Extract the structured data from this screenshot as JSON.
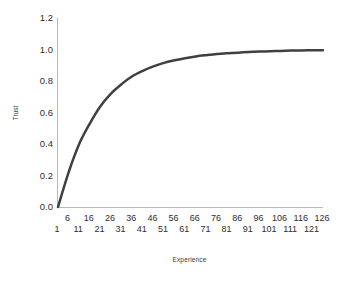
{
  "chart_data": {
    "type": "line",
    "title": "",
    "xlabel": "Experience",
    "ylabel": "Trust",
    "xlim": [
      1,
      126
    ],
    "ylim": [
      0.0,
      1.2
    ],
    "grid": false,
    "legend": null,
    "line_color": "#404040",
    "line_width": 2.5,
    "axis_color": "#b9b9b9",
    "background": "#ffffff",
    "ytick_labels": [
      "1.2",
      "1.0",
      "0.8",
      "0.6",
      "0.4",
      "0.2",
      "0.0"
    ],
    "ytick_values": [
      1.2,
      1.0,
      0.8,
      0.6,
      0.4,
      0.2,
      0.0
    ],
    "xtick_labels_top": [
      "6",
      "16",
      "26",
      "36",
      "46",
      "56",
      "66",
      "76",
      "86",
      "96",
      "106",
      "116",
      "126"
    ],
    "xtick_labels_bottom": [
      "1",
      "11",
      "21",
      "31",
      "41",
      "51",
      "61",
      "71",
      "81",
      "91",
      "101",
      "111",
      "121"
    ],
    "xtick_values_top": [
      6,
      16,
      26,
      36,
      46,
      56,
      66,
      76,
      86,
      96,
      106,
      116,
      126
    ],
    "xtick_values_bottom": [
      1,
      11,
      21,
      31,
      41,
      51,
      61,
      71,
      81,
      91,
      101,
      111,
      121
    ],
    "x": [
      1,
      6,
      11,
      16,
      21,
      26,
      31,
      36,
      41,
      46,
      51,
      56,
      61,
      66,
      71,
      76,
      81,
      86,
      91,
      96,
      101,
      106,
      111,
      116,
      121,
      126
    ],
    "values": [
      0.0,
      0.22,
      0.4,
      0.53,
      0.64,
      0.72,
      0.78,
      0.83,
      0.865,
      0.893,
      0.915,
      0.932,
      0.945,
      0.956,
      0.964,
      0.971,
      0.976,
      0.98,
      0.984,
      0.987,
      0.989,
      0.991,
      0.993,
      0.994,
      0.995,
      0.996
    ],
    "series": [
      {
        "name": "Trust",
        "values": [
          0.0,
          0.22,
          0.4,
          0.53,
          0.64,
          0.72,
          0.78,
          0.83,
          0.865,
          0.893,
          0.915,
          0.932,
          0.945,
          0.956,
          0.964,
          0.971,
          0.976,
          0.98,
          0.984,
          0.987,
          0.989,
          0.991,
          0.993,
          0.994,
          0.995,
          0.996
        ]
      }
    ]
  }
}
